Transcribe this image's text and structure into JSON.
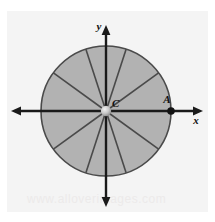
{
  "figure": {
    "panel": {
      "background_color": "#f4f4f4",
      "outer_background_color": "#ffffff",
      "x": 7,
      "y": 11,
      "width": 201,
      "height": 201
    },
    "axes": {
      "x_axis_label": "x",
      "y_axis_label": "y",
      "x_axis": {
        "y": 111,
        "x_start": 13,
        "x_end": 202,
        "arrow_left": true,
        "arrow_right": true
      },
      "y_axis": {
        "x": 106,
        "y_start": 26,
        "y_end": 206,
        "arrow_up": true,
        "arrow_down": true
      },
      "stroke_color": "#1a1a1a",
      "stroke_width": 2.2
    },
    "circle": {
      "center_label": "C",
      "center_x": 106,
      "center_y": 111,
      "radius": 65,
      "fill_color": "#b2b2b2",
      "stroke_color": "#4a4a4a",
      "stroke_width": 1.6
    },
    "sectors": {
      "count": 10,
      "angle_degrees_each": 36,
      "start_angle_degrees": 0,
      "spoke_angles_degrees": [
        0,
        36,
        72,
        108,
        144,
        180,
        216,
        252,
        288,
        324
      ],
      "spoke_color": "#4a4a4a",
      "spoke_width": 1.6
    },
    "points": [
      {
        "name": "C",
        "label": "C",
        "x": 106,
        "y": 111,
        "label_dx": 6,
        "label_dy": -4,
        "marker": "center-dot"
      },
      {
        "name": "A",
        "label": "A",
        "x": 171,
        "y": 111,
        "label_dx": -3,
        "label_dy": -8,
        "marker": "filled-dot"
      }
    ],
    "watermark": "www.alloverimages.com"
  }
}
